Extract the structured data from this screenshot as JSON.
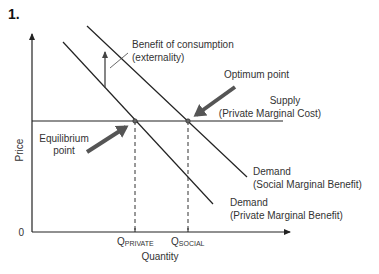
{
  "figure": {
    "number": "1."
  },
  "axes": {
    "y_label": "Price",
    "x_label": "Quantity",
    "origin_label": "0"
  },
  "curves": {
    "supply": {
      "line1": "Supply",
      "line2": "(Private Marginal Cost)"
    },
    "demand_social": {
      "line1": "Demand",
      "line2": "(Social Marginal Benefit)"
    },
    "demand_private": {
      "line1": "Demand",
      "line2": "(Private Marginal Benefit)"
    }
  },
  "annotations": {
    "externality": {
      "line1": "Benefit of consumption",
      "line2": "(externality)"
    },
    "optimum": "Optimum point",
    "equilibrium": {
      "line1": "Equilibrium",
      "line2": "point"
    }
  },
  "ticks": {
    "q_private": {
      "main": "Q",
      "sub": "PRIVATE"
    },
    "q_social": {
      "main": "Q",
      "sub": "SOCIAL"
    }
  },
  "colors": {
    "line": "#222222",
    "thick_arrow": "#555555",
    "text": "#333333"
  }
}
